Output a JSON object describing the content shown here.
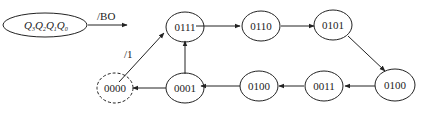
{
  "diagram": {
    "legend": {
      "base": "Q",
      "subscripts": [
        "3",
        "2",
        "1",
        "0"
      ],
      "output_label": "/BO"
    },
    "edge_labels": {
      "start_edge": "/1"
    },
    "states": [
      {
        "id": "s0000",
        "label": "0000",
        "style": "dashed"
      },
      {
        "id": "s0111",
        "label": "0111",
        "style": "solid"
      },
      {
        "id": "s0110",
        "label": "0110",
        "style": "solid"
      },
      {
        "id": "s0101",
        "label": "0101",
        "style": "solid"
      },
      {
        "id": "s0100r",
        "label": "0100",
        "style": "solid"
      },
      {
        "id": "s0011",
        "label": "0011",
        "style": "solid"
      },
      {
        "id": "s0100l",
        "label": "0100",
        "style": "solid"
      },
      {
        "id": "s0001",
        "label": "0001",
        "style": "solid"
      }
    ],
    "transitions": [
      [
        "0000",
        "0111"
      ],
      [
        "0111",
        "0110"
      ],
      [
        "0110",
        "0101"
      ],
      [
        "0101",
        "0100"
      ],
      [
        "0100",
        "0011"
      ],
      [
        "0011",
        "0100"
      ],
      [
        "0100",
        "0001"
      ],
      [
        "0001",
        "0111"
      ],
      [
        "0001",
        "0000"
      ]
    ]
  }
}
